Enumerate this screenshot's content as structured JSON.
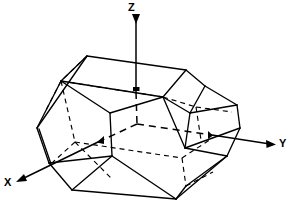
{
  "figure": {
    "background_color": "#ffffff",
    "line_color": "#000000",
    "width": 291,
    "height": 202
  },
  "axes": {
    "origin": {
      "x": 137,
      "y": 124
    },
    "items": [
      {
        "name": "z-axis",
        "label": "Z",
        "label_x": 128,
        "label_y": 2,
        "direction": "up",
        "tip": {
          "x": 136,
          "y": 18
        },
        "tail": {
          "x": 137,
          "y": 124
        },
        "arrow_at": "tip",
        "style": "solid-above-crystal dashed-inside"
      },
      {
        "name": "y-axis",
        "label": "Y",
        "label_x": 279,
        "label_y": 138,
        "direction": "right",
        "tip": {
          "x": 276,
          "y": 144
        },
        "tail": {
          "x": 137,
          "y": 124
        },
        "arrow_at": "tip",
        "style": "solid-outside dashed-inside"
      },
      {
        "name": "x-axis",
        "label": "X",
        "label_x": 4,
        "label_y": 177,
        "direction": "down-left",
        "tip": {
          "x": 16,
          "y": 182
        },
        "tail": {
          "x": 137,
          "y": 124
        },
        "arrow_at": "tip",
        "style": "solid-outside dashed-inside"
      }
    ]
  },
  "crystal": {
    "type": "polyhedron-line-drawing",
    "description": "Hexagonal prism crystal with bevelled terminations drawn in oblique projection; visible edges solid, hidden edges dashed.",
    "visible_edges_style": "solid",
    "hidden_edges_style": "dashed",
    "stroke_width": 1.2,
    "vertices": {
      "top_back_left": {
        "x": 87,
        "y": 56
      },
      "top_back_right": {
        "x": 186,
        "y": 70
      },
      "top_front_left": {
        "x": 61,
        "y": 81
      },
      "top_front_right": {
        "x": 163,
        "y": 97
      },
      "upper_right_a": {
        "x": 205,
        "y": 86
      },
      "upper_right_b": {
        "x": 237,
        "y": 105
      },
      "mid_left_upper": {
        "x": 37,
        "y": 128
      },
      "mid_left_lower": {
        "x": 49,
        "y": 163
      },
      "mid_right_upper": {
        "x": 240,
        "y": 128
      },
      "mid_right_lower": {
        "x": 227,
        "y": 156
      },
      "bottom_front_left": {
        "x": 72,
        "y": 190
      },
      "bottom_front_right": {
        "x": 176,
        "y": 199
      },
      "bottom_back_right": {
        "x": 186,
        "y": 186
      },
      "bottom_back_left": {
        "x": 112,
        "y": 156
      },
      "inner_top_left": {
        "x": 110,
        "y": 113
      },
      "inner_bottom_right": {
        "x": 213,
        "y": 172
      }
    }
  }
}
